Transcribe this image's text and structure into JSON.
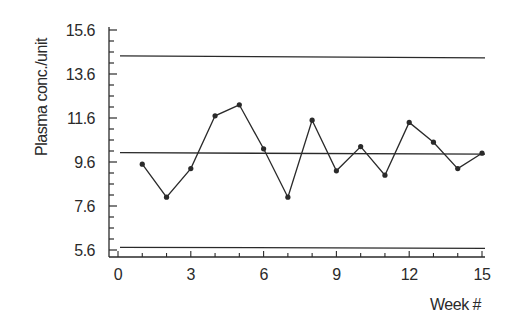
{
  "chart_data": {
    "type": "line",
    "title": "",
    "xlabel": "Week #",
    "ylabel": "Plasma conc./unit",
    "x": [
      1,
      2,
      3,
      4,
      5,
      6,
      7,
      8,
      9,
      10,
      11,
      12,
      13,
      14,
      15
    ],
    "series": [
      {
        "name": "Plasma concentration",
        "values": [
          9.5,
          8.0,
          9.3,
          11.7,
          12.2,
          10.2,
          8.0,
          11.5,
          9.2,
          10.3,
          9.0,
          11.4,
          10.5,
          9.3,
          10.0
        ],
        "marker": "circle"
      }
    ],
    "reference_lines": [
      {
        "name": "upper control limit",
        "y": 14.4
      },
      {
        "name": "center line (mean)",
        "y": 10.0
      },
      {
        "name": "lower control limit",
        "y": 5.7
      }
    ],
    "xticks": [
      0,
      3,
      6,
      9,
      12,
      15
    ],
    "xtick_labels": [
      "0",
      "3",
      "6",
      "9",
      "12",
      "15"
    ],
    "yticks": [
      5.6,
      7.6,
      9.6,
      11.6,
      13.6,
      15.6
    ],
    "ytick_labels": [
      "5.6",
      "7.6",
      "9.6",
      "11.6",
      "13.6",
      "15.6"
    ],
    "xlim": [
      0,
      15
    ],
    "ylim": [
      5.6,
      15.6
    ],
    "grid": false,
    "legend": null,
    "colors": {
      "line": "#2a2a2a",
      "axis": "#2a2a2a",
      "text": "#2a2a2a",
      "background": "#ffffff"
    }
  }
}
